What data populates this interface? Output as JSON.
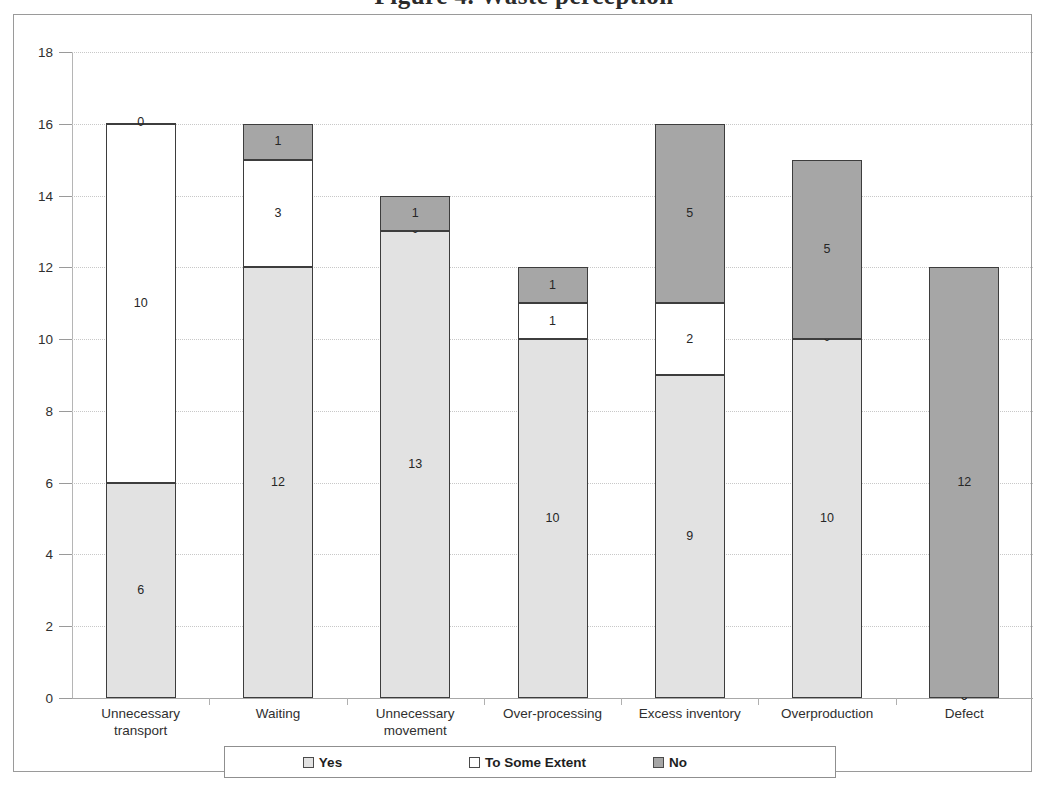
{
  "title": {
    "text": "Figure 4.  Waste perception"
  },
  "legend": {
    "items": [
      {
        "label": "Yes",
        "swatch": "yes-swatch",
        "color": "#e2e2e2"
      },
      {
        "label": "To Some Extent",
        "swatch": "to-some-extent-swatch",
        "color": "#ffffff"
      },
      {
        "label": "No",
        "swatch": "no-swatch",
        "color": "#a6a6a6"
      }
    ]
  },
  "axis": {
    "y_ticks": [
      "0",
      "2",
      "4",
      "6",
      "8",
      "10",
      "12",
      "14",
      "16",
      "18"
    ]
  },
  "chart_data": {
    "type": "bar",
    "stacked": true,
    "title": "Figure 4.  Waste perception",
    "xlabel": "",
    "ylabel": "",
    "ylim": [
      0,
      18
    ],
    "ytick_step": 2,
    "grid": true,
    "legend_position": "bottom",
    "categories": [
      "Unnecessary transport",
      "Waiting",
      "Unnecessary movement",
      "Over-processing",
      "Excess inventory",
      "Overproduction",
      "Defect"
    ],
    "category_lines": [
      [
        "Unnecessary",
        "transport"
      ],
      [
        "Waiting"
      ],
      [
        "Unnecessary",
        "movement"
      ],
      [
        "Over-processing"
      ],
      [
        "Excess inventory"
      ],
      [
        "Overproduction"
      ],
      [
        "Defect"
      ]
    ],
    "series": [
      {
        "name": "Yes",
        "color": "#e2e2e2",
        "values": [
          6,
          12,
          13,
          10,
          9,
          10,
          0
        ]
      },
      {
        "name": "To Some Extent",
        "color": "#ffffff",
        "values": [
          10,
          3,
          0,
          1,
          2,
          0,
          0
        ]
      },
      {
        "name": "No",
        "color": "#a6a6a6",
        "values": [
          0,
          1,
          1,
          1,
          5,
          5,
          12
        ]
      }
    ],
    "totals": [
      16,
      16,
      14,
      12,
      16,
      15,
      12
    ]
  }
}
